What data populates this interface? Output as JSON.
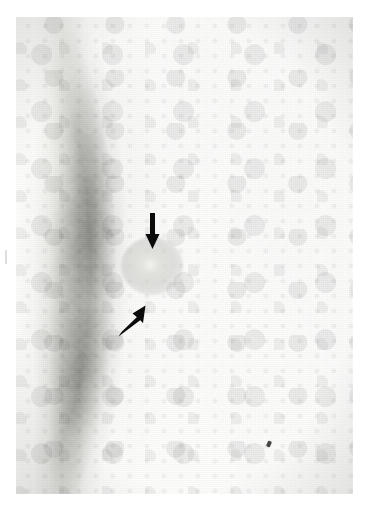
{
  "document": {
    "type": "radiograph",
    "modality": "Mammogram",
    "view_description": "Mediolateral breast radiograph showing a circumscribed dense mass",
    "caption": ""
  },
  "viewer": {
    "background_color": "#ffffff",
    "plate": {
      "name": "x-ray-film",
      "left": 16,
      "top": 17,
      "width": 337,
      "height": 477,
      "base_color": "#1a1a1a"
    }
  },
  "regions": [
    {
      "name": "chest-wall-band",
      "label": "Chest wall / pectoral bright band",
      "color": "#fbfbf9",
      "description": "Near-white vertical band along the left edge of the film"
    },
    {
      "name": "skin-contour",
      "label": "Skin line",
      "color": "#f3f3f0",
      "description": "Bright curved breast border sweeping from upper-left down to lower-left"
    },
    {
      "name": "fatty-tissue",
      "label": "Radiolucent fatty tissue",
      "color": "#1d1d1c",
      "description": "Large dark field occupying the upper-right portion"
    },
    {
      "name": "fibroglandular-tissue",
      "label": "Fibroglandular parenchyma",
      "color": "#8e8e8a",
      "description": "Mottled mid-grey tissue filling the lower half"
    },
    {
      "name": "fibrous-band",
      "label": "Fibrous septal band",
      "color": "#b9b9b5",
      "description": "Faint diagonal line crossing the upper mid-field"
    }
  ],
  "findings": [
    {
      "name": "lesion",
      "label": "Circumscribed dense mass",
      "color": "#e8e8e4",
      "center_x": 136,
      "center_y": 249,
      "approx_diameter_px": 28
    },
    {
      "name": "microcalcification-speck",
      "label": "Punctate dense speck",
      "color": "#0a0a0a",
      "center_x": 253,
      "center_y": 427
    }
  ],
  "annotations": [
    {
      "name": "arrow-down",
      "label": "Downward annotation arrow",
      "direction": "down",
      "color": "#0b0b0b",
      "tail_x": 136,
      "tail_y": 196,
      "tip_x": 136,
      "tip_y": 233,
      "points_to": "lesion"
    },
    {
      "name": "arrow-up-right",
      "label": "Upward-right annotation arrow",
      "direction": "up-right",
      "color": "#0b0b0b",
      "tail_x": 100,
      "tail_y": 318,
      "tip_x": 130,
      "tip_y": 289,
      "points_to": "lesion"
    }
  ],
  "artifacts": [
    {
      "name": "margin-tick",
      "label": "Scan edge tick mark",
      "color": "#c3c3c3"
    }
  ]
}
